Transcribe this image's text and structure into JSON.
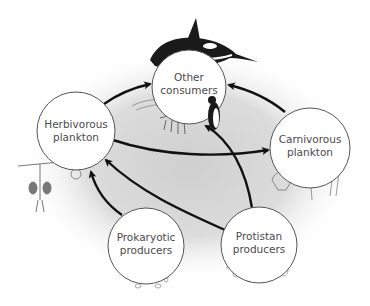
{
  "diagram": {
    "type": "food-web",
    "nodes": [
      {
        "id": "other_consumers",
        "line1": "Other",
        "line2": "consumers",
        "cx": 189,
        "cy": 87,
        "r": 37
      },
      {
        "id": "herbivorous_plankton",
        "line1": "Herbivorous",
        "line2": "plankton",
        "cx": 76,
        "cy": 131,
        "r": 39
      },
      {
        "id": "carnivorous_plankton",
        "line1": "Carnivorous",
        "line2": "plankton",
        "cx": 310,
        "cy": 148,
        "r": 40
      },
      {
        "id": "prokaryotic_producers",
        "line1": "Prokaryotic",
        "line2": "producers",
        "cx": 146,
        "cy": 246,
        "r": 38
      },
      {
        "id": "protistan_producers",
        "line1": "Protistan",
        "line2": "producers",
        "cx": 259,
        "cy": 245,
        "r": 38
      }
    ],
    "edges": [
      {
        "from": "herbivorous_plankton",
        "to": "other_consumers"
      },
      {
        "from": "carnivorous_plankton",
        "to": "other_consumers"
      },
      {
        "from": "herbivorous_plankton",
        "to": "carnivorous_plankton"
      },
      {
        "from": "prokaryotic_producers",
        "to": "herbivorous_plankton"
      },
      {
        "from": "protistan_producers",
        "to": "herbivorous_plankton"
      },
      {
        "from": "protistan_producers",
        "to": "other_consumers"
      }
    ],
    "illustrations": [
      "orca",
      "penguin",
      "fish",
      "krill",
      "copepod",
      "radiolarian",
      "ctenophore",
      "chaetognath",
      "bacteria",
      "diatoms"
    ],
    "colors": {
      "arrow": "#111111",
      "circle_stroke": "#555555",
      "circle_fill": "#ffffff",
      "background_shade": "#d6d6d6",
      "label": "#4a4a4a"
    }
  }
}
